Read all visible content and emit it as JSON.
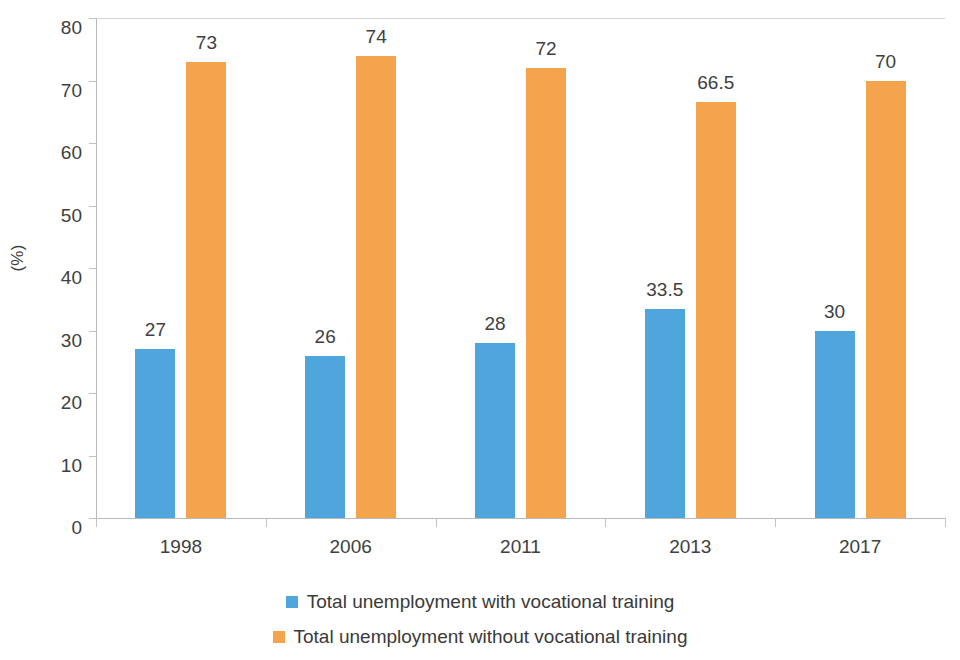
{
  "chart_data": {
    "type": "bar",
    "title": "",
    "subtitle": "",
    "xlabel": "",
    "ylabel": "(%)",
    "categories": [
      "1998",
      "2006",
      "2011",
      "2013",
      "2017"
    ],
    "series": [
      {
        "name": "Total unemployment with vocational training",
        "color": "#4FA6DC",
        "values": [
          27,
          26,
          28,
          33.5,
          30
        ],
        "labels": [
          "27",
          "26",
          "28",
          "33.5",
          "30"
        ]
      },
      {
        "name": "Total unemployment without vocational training",
        "color": "#F5A44E",
        "values": [
          73,
          74,
          72,
          66.5,
          70
        ],
        "labels": [
          "73",
          "74",
          "72",
          "66.5",
          "70"
        ]
      }
    ],
    "ylim": [
      0,
      80
    ],
    "yticks": [
      0,
      10,
      20,
      30,
      40,
      50,
      60,
      70,
      80
    ],
    "ytick_labels": [
      "0",
      "10",
      "20",
      "30",
      "40",
      "50",
      "60",
      "70",
      "80"
    ],
    "grid": false,
    "legend_position": "bottom",
    "data_labels_shown": true
  },
  "axes": {
    "y_title": "(%)",
    "y_tick_labels": [
      "80",
      "70",
      "60",
      "50",
      "40",
      "30",
      "20",
      "10",
      "0"
    ],
    "x_tick_labels": [
      "1998",
      "2006",
      "2011",
      "2013",
      "2017"
    ]
  },
  "legend": {
    "items": [
      {
        "label": "Total unemployment with vocational training",
        "color": "#4FA6DC"
      },
      {
        "label": "Total unemployment without vocational training",
        "color": "#F5A44E"
      }
    ]
  },
  "colors": {
    "series_with_training": "#4FA6DC",
    "series_without_training": "#F5A44E",
    "text": "#404040",
    "axis": "#b9b9b9",
    "background": "#ffffff"
  }
}
